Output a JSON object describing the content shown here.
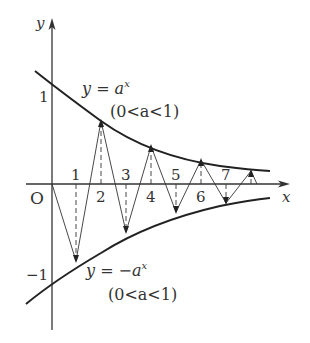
{
  "diagram": {
    "axes": {
      "x_label": "x",
      "y_label": "y",
      "origin_label": "O",
      "y_tick_pos": "1",
      "y_tick_neg": "−1"
    },
    "curves": {
      "upper": {
        "eq_prefix": "y = a",
        "exp": "x",
        "cond": "(0<a<1)"
      },
      "lower": {
        "eq_prefix": "y = −a",
        "exp": "x",
        "cond": "(0<a<1)"
      }
    },
    "points": [
      "1",
      "2",
      "3",
      "4",
      "5",
      "6",
      "7"
    ],
    "colors": {
      "line": "#222222",
      "text": "#333333"
    }
  }
}
